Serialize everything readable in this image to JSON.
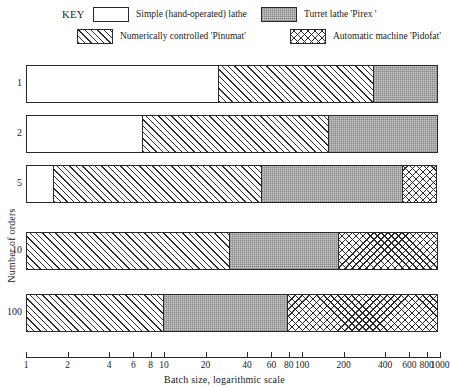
{
  "legend": {
    "key_label": "KEY",
    "items": [
      {
        "id": "simple",
        "label": "Simple (hand-operated) lathe",
        "pattern": "plain"
      },
      {
        "id": "turret",
        "label": "Turret lathe 'Pirex '",
        "pattern": "gray"
      },
      {
        "id": "numerical",
        "label": "Numerically controlled 'Pinumat'",
        "pattern": "hatch"
      },
      {
        "id": "automatic",
        "label": "Automatic machine 'Pidofat'",
        "pattern": "cross"
      }
    ]
  },
  "axes": {
    "xlabel": "Batch size, logarithmic scale",
    "ylabel": "Number of orders",
    "xticks": [
      {
        "value": 1,
        "label": "1"
      },
      {
        "value": 2,
        "label": "2"
      },
      {
        "value": 4,
        "label": "4"
      },
      {
        "value": 6,
        "label": "6"
      },
      {
        "value": 8,
        "label": "8"
      },
      {
        "value": 10,
        "label": "10"
      },
      {
        "value": 20,
        "label": "20"
      },
      {
        "value": 40,
        "label": "40"
      },
      {
        "value": 60,
        "label": "60"
      },
      {
        "value": 80,
        "label": "80"
      },
      {
        "value": 100,
        "label": "100"
      },
      {
        "value": 200,
        "label": "200"
      },
      {
        "value": 400,
        "label": "400"
      },
      {
        "value": 600,
        "label": "600"
      },
      {
        "value": 800,
        "label": "800"
      },
      {
        "value": 1000,
        "label": "1000"
      }
    ]
  },
  "chart_data": {
    "type": "bar",
    "orientation": "horizontal",
    "stacked": true,
    "scale": "log",
    "title": "",
    "xlabel": "Batch size, logarithmic scale",
    "ylabel": "Number of orders",
    "xlim": [
      1,
      1000
    ],
    "grid": false,
    "legend_position": "top",
    "categories": [
      "1",
      "2",
      "5",
      "10",
      "100"
    ],
    "series": [
      {
        "name": "Simple (hand-operated) lathe",
        "pattern": "plain",
        "breakpoints": [
          25,
          7,
          1.6,
          1,
          1
        ]
      },
      {
        "name": "Numerically controlled 'Pinumat'",
        "pattern": "hatch",
        "breakpoints": [
          340,
          160,
          52,
          30,
          10
        ]
      },
      {
        "name": "Turret lathe 'Pirex '",
        "pattern": "gray",
        "breakpoints": [
          1000,
          1000,
          560,
          190,
          80
        ]
      },
      {
        "name": "Automatic machine 'Pidofat'",
        "pattern": "cross",
        "breakpoints": [
          1000,
          1000,
          1000,
          1000,
          1000
        ]
      }
    ],
    "rows": [
      {
        "category": "1",
        "segments": [
          {
            "name": "Simple (hand-operated) lathe",
            "pattern": "plain",
            "from": 1,
            "to": 25
          },
          {
            "name": "Numerically controlled 'Pinumat'",
            "pattern": "hatch",
            "from": 25,
            "to": 340
          },
          {
            "name": "Turret lathe 'Pirex '",
            "pattern": "gray",
            "from": 340,
            "to": 1000
          }
        ]
      },
      {
        "category": "2",
        "segments": [
          {
            "name": "Simple (hand-operated) lathe",
            "pattern": "plain",
            "from": 1,
            "to": 7
          },
          {
            "name": "Numerically controlled 'Pinumat'",
            "pattern": "hatch",
            "from": 7,
            "to": 160
          },
          {
            "name": "Turret lathe 'Pirex '",
            "pattern": "gray",
            "from": 160,
            "to": 1000
          }
        ]
      },
      {
        "category": "5",
        "segments": [
          {
            "name": "Simple (hand-operated) lathe",
            "pattern": "plain",
            "from": 1,
            "to": 1.6
          },
          {
            "name": "Numerically controlled 'Pinumat'",
            "pattern": "hatch",
            "from": 1.6,
            "to": 52
          },
          {
            "name": "Turret lathe 'Pirex '",
            "pattern": "gray",
            "from": 52,
            "to": 560
          },
          {
            "name": "Automatic machine 'Pidofat'",
            "pattern": "cross",
            "from": 560,
            "to": 1000
          }
        ]
      },
      {
        "category": "10",
        "segments": [
          {
            "name": "Numerically controlled 'Pinumat'",
            "pattern": "hatch",
            "from": 1,
            "to": 30
          },
          {
            "name": "Turret lathe 'Pirex '",
            "pattern": "gray",
            "from": 30,
            "to": 190
          },
          {
            "name": "Automatic machine 'Pidofat'",
            "pattern": "cross",
            "from": 190,
            "to": 1000
          }
        ]
      },
      {
        "category": "100",
        "segments": [
          {
            "name": "Numerically controlled 'Pinumat'",
            "pattern": "hatch",
            "from": 1,
            "to": 10
          },
          {
            "name": "Turret lathe 'Pirex '",
            "pattern": "gray",
            "from": 10,
            "to": 80
          },
          {
            "name": "Automatic machine 'Pidofat'",
            "pattern": "cross",
            "from": 80,
            "to": 1000
          }
        ]
      }
    ]
  },
  "layout": {
    "axis_left_px": 26,
    "axis_right_px": 440,
    "row_tops_px": [
      13,
      63,
      113,
      180,
      242
    ],
    "row_height_px": 38,
    "legend_positions": [
      {
        "id": "simple",
        "left": 93,
        "top": 7
      },
      {
        "id": "turret",
        "left": 261,
        "top": 7
      },
      {
        "id": "numerical",
        "left": 77,
        "top": 29
      },
      {
        "id": "automatic",
        "left": 290,
        "top": 29
      }
    ]
  },
  "colors": {
    "ink": "#2a2a2a",
    "gray_fill": "#c8c8c8",
    "background": "#ffffff"
  }
}
